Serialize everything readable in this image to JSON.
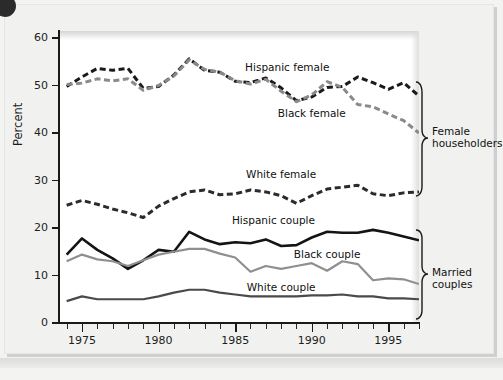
{
  "chart_data": {
    "type": "line",
    "title": "",
    "xlabel": "",
    "ylabel": "Percent",
    "xlim": [
      1973.5,
      1997
    ],
    "ylim": [
      0,
      63
    ],
    "yticks": [
      0,
      10,
      20,
      30,
      40,
      50,
      60
    ],
    "xticks_major": [
      1975,
      1980,
      1985,
      1990,
      1995
    ],
    "xticks_minor": [
      1974,
      1976,
      1977,
      1978,
      1979,
      1981,
      1982,
      1983,
      1984,
      1986,
      1987,
      1988,
      1989,
      1991,
      1992,
      1993,
      1994,
      1996,
      1997
    ],
    "grid": false,
    "legend_position": "inline-annotations",
    "x": [
      1974,
      1975,
      1976,
      1977,
      1978,
      1979,
      1980,
      1981,
      1982,
      1983,
      1984,
      1985,
      1986,
      1987,
      1988,
      1989,
      1990,
      1991,
      1992,
      1993,
      1994,
      1995,
      1996,
      1997
    ],
    "series": [
      {
        "name": "Hispanic female",
        "group": "Female householders",
        "style": "dashed",
        "color": "#1a1a1a",
        "width": 3.0,
        "values": [
          49.8,
          51.8,
          53.6,
          53.2,
          53.6,
          49.4,
          49.8,
          52.2,
          55.6,
          53.2,
          52.8,
          50.9,
          50.6,
          51.6,
          49.5,
          46.8,
          47.6,
          49.6,
          49.8,
          51.8,
          50.6,
          49.2,
          50.6,
          47.8
        ]
      },
      {
        "name": "Black female",
        "group": "Female householders",
        "style": "dashed",
        "color": "#8a8a8a",
        "width": 3.0,
        "values": [
          50.2,
          50.5,
          51.4,
          51.0,
          51.4,
          49.0,
          50.0,
          52.0,
          55.4,
          53.4,
          52.8,
          51.0,
          50.3,
          51.3,
          48.8,
          46.6,
          48.0,
          50.8,
          49.6,
          46.0,
          45.5,
          44.0,
          42.6,
          40.0
        ]
      },
      {
        "name": "White female",
        "group": "Female householders",
        "style": "dashed",
        "color": "#2b2b2b",
        "width": 3.0,
        "values": [
          24.8,
          25.8,
          25.0,
          24.0,
          23.2,
          22.2,
          24.6,
          26.2,
          27.6,
          28.0,
          27.0,
          27.2,
          28.0,
          27.6,
          26.8,
          25.2,
          26.8,
          28.2,
          28.6,
          29.0,
          27.2,
          26.8,
          27.4,
          27.6
        ]
      },
      {
        "name": "Hispanic couple",
        "group": "Married couples",
        "style": "solid",
        "color": "#141414",
        "width": 2.6,
        "values": [
          14.4,
          17.8,
          15.4,
          13.6,
          11.4,
          13.2,
          15.4,
          15.0,
          19.2,
          17.6,
          16.6,
          17.0,
          16.8,
          17.6,
          16.2,
          16.4,
          18.0,
          19.2,
          19.0,
          19.0,
          19.6,
          19.0,
          18.2,
          17.4
        ]
      },
      {
        "name": "Black couple",
        "group": "Married couples",
        "style": "solid",
        "color": "#8f8f8f",
        "width": 2.2,
        "values": [
          13.0,
          14.4,
          13.4,
          13.0,
          12.0,
          13.2,
          14.4,
          15.0,
          15.6,
          15.6,
          14.6,
          13.8,
          10.8,
          12.0,
          11.4,
          12.0,
          12.6,
          11.0,
          13.0,
          12.4,
          9.0,
          9.4,
          9.2,
          8.2
        ]
      },
      {
        "name": "White couple",
        "group": "Married couples",
        "style": "solid",
        "color": "#4a4a4a",
        "width": 2.2,
        "values": [
          4.6,
          5.6,
          5.0,
          5.0,
          5.0,
          5.0,
          5.6,
          6.4,
          7.0,
          7.0,
          6.4,
          6.0,
          5.6,
          5.6,
          5.6,
          5.6,
          5.8,
          5.8,
          6.0,
          5.6,
          5.6,
          5.2,
          5.2,
          5.0
        ]
      }
    ],
    "groups": [
      {
        "label": "Female householders",
        "y_range": [
          26,
          57
        ]
      },
      {
        "label": "Married couples",
        "y_range": [
          4,
          20
        ]
      }
    ],
    "annotations": [
      {
        "text": "Hispanic female",
        "x": 1988.4,
        "y": 54.0
      },
      {
        "text": "Black female",
        "x": 1990.0,
        "y": 44.3
      },
      {
        "text": "White female",
        "x": 1988.0,
        "y": 31.4
      },
      {
        "text": "Hispanic couple",
        "x": 1987.5,
        "y": 21.6
      },
      {
        "text": "Black couple",
        "x": 1991.0,
        "y": 14.6
      },
      {
        "text": "White couple",
        "x": 1988.0,
        "y": 7.6
      }
    ]
  }
}
